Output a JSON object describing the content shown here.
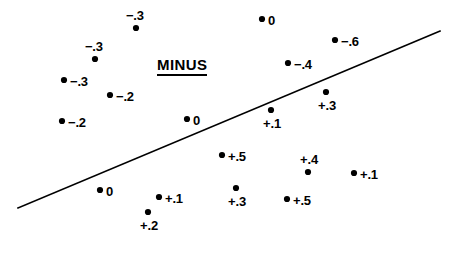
{
  "figure": {
    "background_color": "#ffffff",
    "ink_color": "#000000",
    "width": 458,
    "height": 260
  },
  "annotations": {
    "group_title": "MINUS",
    "group_title_x": 157,
    "group_title_y": 56,
    "group_title_underlined": true
  },
  "chart_data": {
    "type": "scatter",
    "title": "MINUS",
    "xlabel": "",
    "ylabel": "",
    "grid": false,
    "legend": "none",
    "axes_visible": false,
    "note": "Scatter of labelled residual values with a single straight divider line running lower-left to upper-right; negative values cluster above the line, positive values below.",
    "divider_line": {
      "x1": 18,
      "y1": 208,
      "x2": 440,
      "y2": 31,
      "width_px": 1.6
    },
    "value_labels": [
      "-.3",
      "0",
      "-.3",
      "-.6",
      "-.3",
      "-.4",
      "-.2",
      "+.3",
      "-.2",
      "0",
      "+.1",
      "+.5",
      "+.4",
      "+.1",
      "0",
      "+.1",
      "+.3",
      "+.5",
      "+.2"
    ],
    "points": [
      {
        "label": "−.3",
        "value": -0.3,
        "x": 136,
        "y": 28,
        "label_pos": "above-left"
      },
      {
        "label": "0",
        "value": 0.0,
        "x": 262,
        "y": 19,
        "label_pos": "right"
      },
      {
        "label": "−.3",
        "value": -0.3,
        "x": 95,
        "y": 59,
        "label_pos": "above-left"
      },
      {
        "label": "−.6",
        "value": -0.6,
        "x": 335,
        "y": 40,
        "label_pos": "right"
      },
      {
        "label": "−.3",
        "value": -0.3,
        "x": 64,
        "y": 80,
        "label_pos": "right"
      },
      {
        "label": "−.4",
        "value": -0.4,
        "x": 288,
        "y": 63,
        "label_pos": "right"
      },
      {
        "label": "−.2",
        "value": -0.2,
        "x": 110,
        "y": 95,
        "label_pos": "right"
      },
      {
        "label": "+.3",
        "value": 0.3,
        "x": 326,
        "y": 92,
        "label_pos": "below"
      },
      {
        "label": "−.2",
        "value": -0.2,
        "x": 62,
        "y": 121,
        "label_pos": "right"
      },
      {
        "label": "0",
        "value": 0.0,
        "x": 187,
        "y": 119,
        "label_pos": "right"
      },
      {
        "label": "+.1",
        "value": 0.1,
        "x": 271,
        "y": 110,
        "label_pos": "below"
      },
      {
        "label": "+.5",
        "value": 0.5,
        "x": 222,
        "y": 155,
        "label_pos": "right"
      },
      {
        "label": "+.4",
        "value": 0.4,
        "x": 308,
        "y": 172,
        "label_pos": "above"
      },
      {
        "label": "+.1",
        "value": 0.1,
        "x": 354,
        "y": 173,
        "label_pos": "right"
      },
      {
        "label": "0",
        "value": 0.0,
        "x": 100,
        "y": 190,
        "label_pos": "right"
      },
      {
        "label": "+.1",
        "value": 0.1,
        "x": 159,
        "y": 197,
        "label_pos": "right"
      },
      {
        "label": "+.3",
        "value": 0.3,
        "x": 236,
        "y": 188,
        "label_pos": "below"
      },
      {
        "label": "+.5",
        "value": 0.5,
        "x": 287,
        "y": 199,
        "label_pos": "right"
      },
      {
        "label": "+.2",
        "value": 0.2,
        "x": 148,
        "y": 212,
        "label_pos": "below"
      }
    ]
  }
}
